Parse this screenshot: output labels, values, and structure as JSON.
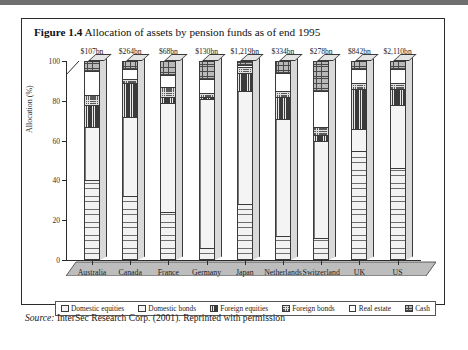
{
  "figure": {
    "number": "Figure 1.4",
    "title": "Allocation of assets by pension funds as of end 1995",
    "source_prefix": "Source:",
    "source_text": " InterSec Research Corp. (2001). Reprinted with permission"
  },
  "chart_data": {
    "type": "bar",
    "subtype": "stacked-column-3d",
    "title": "Allocation of assets by pension funds as of end 1995",
    "xlabel": "",
    "ylabel": "Allocation (%)",
    "ylim": [
      0,
      100
    ],
    "yticks": [
      0,
      20,
      40,
      60,
      80,
      100
    ],
    "grid": false,
    "legend_position": "bottom",
    "categories": [
      "Australia",
      "Canada",
      "France",
      "Germany",
      "Japan",
      "Netherlands",
      "Switzerland",
      "UK",
      "US"
    ],
    "category_value_labels": [
      "$107bn",
      "$264bn",
      "$68bn",
      "$130bn",
      "$1,219bn",
      "$334bn",
      "$278bn",
      "$842bn",
      "$2,110bn"
    ],
    "series": [
      {
        "name": "Domestic equities",
        "fill": "f-domestic-equities",
        "values": [
          40,
          32,
          24,
          6,
          28,
          12,
          11,
          55,
          46
        ]
      },
      {
        "name": "Domestic bonds",
        "fill": "f-domestic-bonds",
        "values": [
          27,
          40,
          55,
          75,
          57,
          59,
          49,
          11,
          32
        ]
      },
      {
        "name": "Foreign equities",
        "fill": "f-foreign-equities",
        "values": [
          11,
          17,
          3,
          1,
          9,
          11,
          3,
          20,
          8
        ]
      },
      {
        "name": "Foreign bonds",
        "fill": "f-foreign-bonds",
        "values": [
          5,
          2,
          5,
          2,
          3,
          3,
          4,
          3,
          3
        ]
      },
      {
        "name": "Real estate",
        "fill": "f-real-estate",
        "values": [
          12,
          5,
          6,
          7,
          1,
          9,
          18,
          7,
          7
        ]
      },
      {
        "name": "Cash",
        "fill": "f-cash",
        "values": [
          5,
          4,
          7,
          9,
          2,
          6,
          15,
          4,
          4
        ]
      }
    ]
  }
}
